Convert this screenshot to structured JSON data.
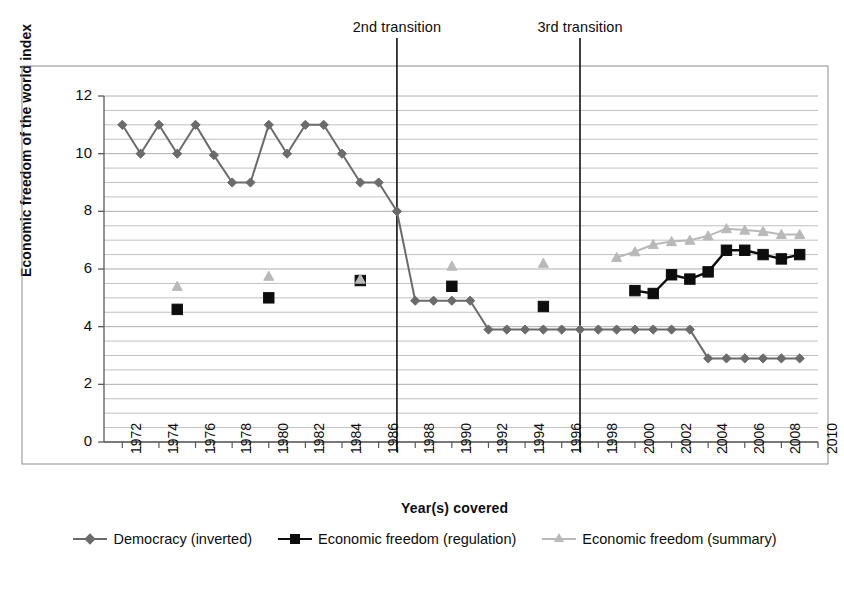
{
  "annotations": [
    {
      "name": "2nd-transition",
      "label": "2nd transition",
      "year": 1987
    },
    {
      "name": "3rd-transition",
      "label": "3rd transition",
      "year": 1997
    }
  ],
  "colors": {
    "democracy": "#6b6b6b",
    "regulation": "#0d0d0d",
    "summary": "#b9b9b9",
    "gridline": "#aaaaaa",
    "axis": "#5a5a5a",
    "frame": "#8c8c8c",
    "text": "#0d0d0d"
  },
  "chart_data": {
    "type": "line",
    "title": "",
    "xlabel": "Year(s) covered",
    "ylabel": "Economic freedom of the world index",
    "xlim": [
      1971,
      2010
    ],
    "ylim": [
      0,
      12
    ],
    "ytick_values": [
      0,
      2,
      4,
      6,
      8,
      10,
      12
    ],
    "ytick_labels": [
      "0",
      "2",
      "4",
      "6",
      "8",
      "10",
      "12"
    ],
    "y_minor_step": 0.5,
    "grid": "horizontal-minor",
    "xtick_labels": [
      "1972",
      "1974",
      "1976",
      "1978",
      "1980",
      "1982",
      "1984",
      "1986",
      "1988",
      "1990",
      "1992",
      "1994",
      "1996",
      "1998",
      "2000",
      "2002",
      "2004",
      "2006",
      "2008",
      "2010"
    ],
    "xtick_values": [
      1972,
      1974,
      1976,
      1978,
      1980,
      1982,
      1984,
      1986,
      1988,
      1990,
      1992,
      1994,
      1996,
      1998,
      2000,
      2002,
      2004,
      2006,
      2008,
      2010
    ],
    "legend_position": "bottom",
    "series": [
      {
        "name": "Democracy (inverted)",
        "marker": "diamond",
        "color": "#6b6b6b",
        "connected": true,
        "x": [
          1972,
          1973,
          1974,
          1975,
          1976,
          1977,
          1978,
          1979,
          1980,
          1981,
          1982,
          1983,
          1984,
          1985,
          1986,
          1987,
          1988,
          1989,
          1990,
          1991,
          1992,
          1993,
          1994,
          1995,
          1996,
          1997,
          1998,
          1999,
          2000,
          2001,
          2002,
          2003,
          2004,
          2005,
          2006,
          2007,
          2008,
          2009
        ],
        "values": [
          11,
          10,
          11,
          10,
          11,
          9.95,
          9,
          9,
          11,
          10,
          11,
          11,
          10,
          9,
          9,
          8,
          4.9,
          4.9,
          4.9,
          4.9,
          3.9,
          3.9,
          3.9,
          3.9,
          3.9,
          3.9,
          3.9,
          3.9,
          3.9,
          3.9,
          3.9,
          3.9,
          2.9,
          2.9,
          2.9,
          2.9,
          2.9,
          2.9
        ]
      },
      {
        "name": "Economic freedom (regulation)",
        "marker": "square",
        "color": "#0d0d0d",
        "connected": true,
        "x": [
          1975,
          1980,
          1985,
          1990,
          1995,
          2000,
          2001,
          2002,
          2003,
          2004,
          2005,
          2006,
          2007,
          2008,
          2009
        ],
        "values": [
          4.6,
          5.0,
          5.6,
          5.4,
          4.7,
          5.25,
          5.15,
          5.8,
          5.65,
          5.9,
          6.65,
          6.65,
          6.5,
          6.35,
          6.5
        ],
        "connected_from": 2000,
        "isolated_points": [
          1975,
          1980,
          1985,
          1990,
          1995
        ]
      },
      {
        "name": "Economic freedom (summary)",
        "marker": "triangle",
        "color": "#b9b9b9",
        "connected": true,
        "x": [
          1975,
          1980,
          1985,
          1990,
          1995,
          1999,
          2000,
          2001,
          2002,
          2003,
          2004,
          2005,
          2006,
          2007,
          2008,
          2009
        ],
        "values": [
          5.4,
          5.75,
          5.65,
          6.1,
          6.2,
          6.4,
          6.6,
          6.85,
          6.95,
          7.0,
          7.15,
          7.4,
          7.35,
          7.3,
          7.2,
          7.2
        ],
        "connected_from": 1999,
        "isolated_points": [
          1975,
          1980,
          1985,
          1990,
          1995
        ]
      }
    ]
  },
  "legend": [
    {
      "label": "Democracy (inverted)",
      "marker": "diamond",
      "color": "#6b6b6b"
    },
    {
      "label": "Economic freedom (regulation)",
      "marker": "square",
      "color": "#0d0d0d"
    },
    {
      "label": "Economic freedom (summary)",
      "marker": "triangle",
      "color": "#b9b9b9"
    }
  ]
}
